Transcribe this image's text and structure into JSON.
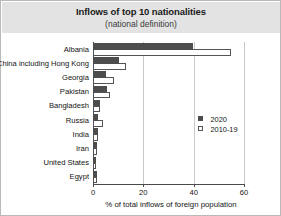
{
  "chart_data": {
    "type": "bar",
    "orientation": "horizontal",
    "title": "Inflows of top 10 nationalities",
    "subtitle": "(national definition)",
    "xlabel": "% of total inflows of foreign population",
    "ylabel": "",
    "xlim": [
      0,
      60
    ],
    "xticks": [
      0,
      20,
      40,
      60
    ],
    "xtick_labels": [
      "0",
      "20",
      "40",
      "60"
    ],
    "grid": true,
    "grid_axis": "x",
    "legend_position": "right-middle",
    "categories": [
      "Albania",
      "China including Hong Kong",
      "Georgia",
      "Pakistan",
      "Bangladesh",
      "Russia",
      "India",
      "Iran",
      "United States",
      "Egypt"
    ],
    "series": [
      {
        "name": "2020",
        "color": "#4d4d4d",
        "style": "filled",
        "values": [
          39.8,
          10.2,
          5.0,
          5.6,
          2.6,
          2.0,
          1.8,
          1.4,
          1.3,
          1.4
        ]
      },
      {
        "name": "2010-19",
        "color": "#ffffff",
        "style": "open",
        "values": [
          55.0,
          13.0,
          8.4,
          6.6,
          2.6,
          4.0,
          1.8,
          1.4,
          1.3,
          1.4
        ]
      }
    ]
  },
  "legend": {
    "entries": [
      {
        "label": "2020",
        "swatch": "filled-square-icon"
      },
      {
        "label": "2010-19",
        "swatch": "open-square-icon"
      }
    ]
  },
  "colors": {
    "series_2020": "#4d4d4d",
    "series_2010_19": "#ffffff",
    "title_band": "#e3e3e3",
    "axis": "#4a4a4a",
    "gridline": "#c8c8c8"
  }
}
